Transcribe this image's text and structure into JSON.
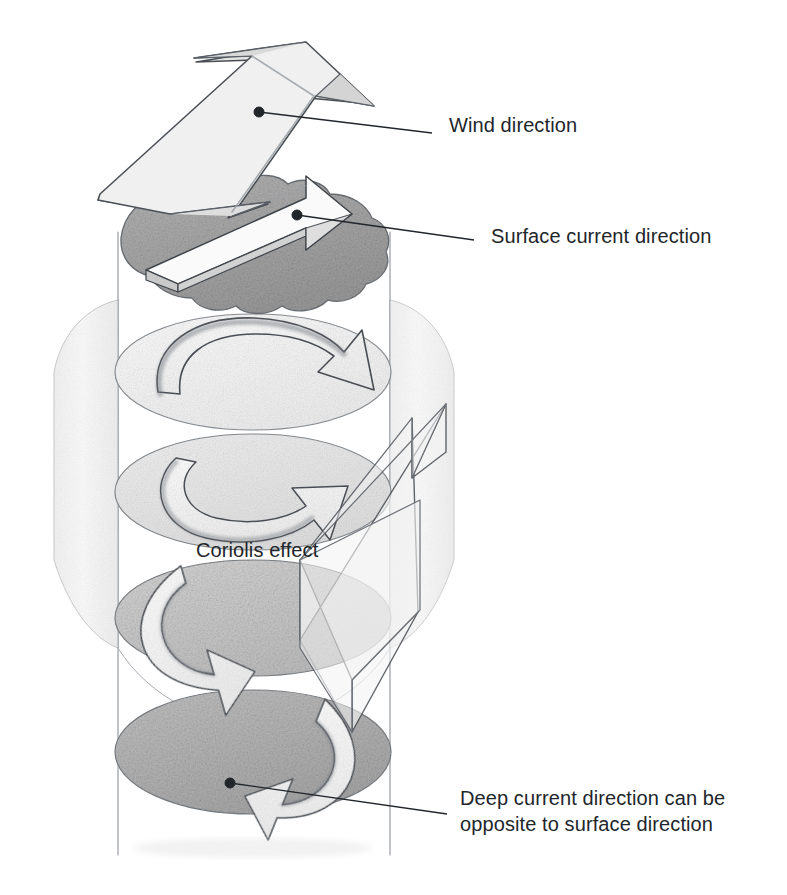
{
  "figure": {
    "title_visible": false,
    "background_color": "#ffffff",
    "ink_color": "#22262b",
    "pencil_line_color": "#5a5f66",
    "style": "pencil sketch scientific illustration"
  },
  "labels": [
    {
      "id": "wind-direction",
      "text": "Wind direction",
      "x": 449,
      "y": 124,
      "leader": {
        "dot_x": 259,
        "dot_y": 112,
        "end_x": 432,
        "end_y": 133
      }
    },
    {
      "id": "surface-current-direction",
      "text": "Surface current direction",
      "x": 491,
      "y": 235,
      "leader": {
        "dot_x": 297,
        "dot_y": 215,
        "end_x": 474,
        "end_y": 240
      }
    },
    {
      "id": "coriolis-effect",
      "text": "Coriolis effect",
      "x": 196,
      "y": 549,
      "leader": null
    },
    {
      "id": "deep-current-direction",
      "text": "Deep current direction can be\nopposite to surface direction",
      "x": 460,
      "y": 800,
      "leader": {
        "dot_x": 230,
        "dot_y": 783,
        "end_x": 447,
        "end_y": 814
      }
    }
  ],
  "diagram": {
    "name": "ekman-spiral",
    "water_column": {
      "left_wall_x": 118,
      "right_wall_x": 390,
      "top_y": 230,
      "bottom_y": 855
    },
    "surface_disc": {
      "name": "ocean-surface",
      "cx": 253,
      "cy": 240,
      "rx": 138,
      "ry": 62,
      "fill": "#a9a9a9",
      "texture": "stippled pencil"
    },
    "layer_discs": [
      {
        "level": 1,
        "cx": 253,
        "cy": 372,
        "rx": 138,
        "ry": 58,
        "fill": "#f2f2f2",
        "arrow_rotation_deg": 0
      },
      {
        "level": 2,
        "cx": 253,
        "cy": 492,
        "rx": 138,
        "ry": 58,
        "fill": "#e2e2e2",
        "arrow_rotation_deg": 40
      },
      {
        "level": 3,
        "cx": 253,
        "cy": 618,
        "rx": 138,
        "ry": 58,
        "fill": "#c9c9c9",
        "arrow_rotation_deg": 95
      },
      {
        "level": 4,
        "cx": 253,
        "cy": 752,
        "rx": 138,
        "ry": 62,
        "fill": "#b4b4b4",
        "arrow_rotation_deg": 165
      }
    ],
    "arrows": [
      {
        "name": "wind-arrow",
        "description": "large bent arrow above the surface pointing upper right",
        "fill": "#ededed"
      },
      {
        "name": "surface-current-arrow",
        "description": "3D arrow on the ocean surface curving right",
        "fill": "#f4f4f4"
      },
      {
        "name": "net-transport-arrow",
        "description": "large translucent diagonal arrow pointing upper right through the column",
        "fill": "#f0f0f0"
      }
    ],
    "spiral_direction": "clockwise with depth (deflection to the right)"
  }
}
